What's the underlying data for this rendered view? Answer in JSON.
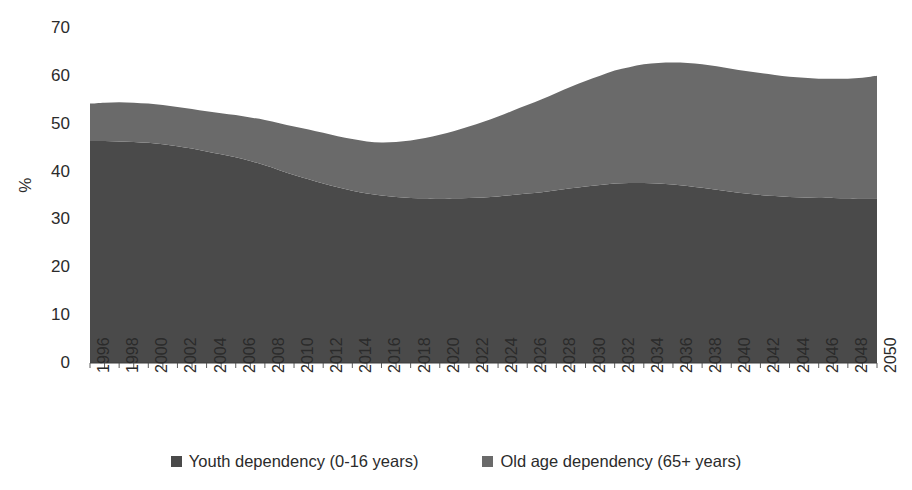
{
  "chart_data": {
    "type": "area",
    "stacked": true,
    "title": "",
    "subtitle": "",
    "xlabel": "",
    "ylabel": "%",
    "ylim": [
      0,
      70
    ],
    "ytick_step": 10,
    "yticks": [
      0,
      10,
      20,
      30,
      40,
      50,
      60,
      70
    ],
    "grid": false,
    "legend_position": "bottom",
    "x": [
      1996,
      1997,
      1998,
      1999,
      2000,
      2001,
      2002,
      2003,
      2004,
      2005,
      2006,
      2007,
      2008,
      2009,
      2010,
      2011,
      2012,
      2013,
      2014,
      2015,
      2016,
      2017,
      2018,
      2019,
      2020,
      2021,
      2022,
      2023,
      2024,
      2025,
      2026,
      2027,
      2028,
      2029,
      2030,
      2031,
      2032,
      2033,
      2034,
      2035,
      2036,
      2037,
      2038,
      2039,
      2040,
      2041,
      2042,
      2043,
      2044,
      2045,
      2046,
      2047,
      2048,
      2049,
      2050
    ],
    "xtick_labels": [
      "1996",
      "1998",
      "2000",
      "2002",
      "2004",
      "2006",
      "2008",
      "2010",
      "2012",
      "2014",
      "2016",
      "2018",
      "2020",
      "2022",
      "2024",
      "2026",
      "2028",
      "2030",
      "2032",
      "2034",
      "2036",
      "2038",
      "2040",
      "2042",
      "2044",
      "2046",
      "2048",
      "2050"
    ],
    "series": [
      {
        "name": "Youth dependency (0-16 years)",
        "color": "#4a4a4a",
        "values": [
          46.4,
          46.4,
          46.3,
          46.2,
          46.0,
          45.7,
          45.3,
          44.8,
          44.2,
          43.6,
          43.0,
          42.2,
          41.3,
          40.3,
          39.3,
          38.4,
          37.5,
          36.7,
          36.0,
          35.4,
          35.0,
          34.7,
          34.5,
          34.4,
          34.4,
          34.4,
          34.5,
          34.6,
          34.8,
          35.1,
          35.4,
          35.7,
          36.1,
          36.5,
          36.9,
          37.2,
          37.5,
          37.6,
          37.6,
          37.5,
          37.3,
          37.0,
          36.6,
          36.2,
          35.8,
          35.4,
          35.1,
          34.9,
          34.7,
          34.6,
          34.5,
          34.5,
          34.4,
          34.4,
          34.4
        ]
      },
      {
        "name": "Old age dependency (65+ years)",
        "color": "#6a6a6a",
        "values": [
          7.8,
          8.0,
          8.2,
          8.2,
          8.2,
          8.2,
          8.2,
          8.3,
          8.4,
          8.6,
          8.8,
          9.1,
          9.5,
          9.8,
          10.1,
          10.4,
          10.6,
          10.7,
          10.8,
          10.9,
          11.1,
          11.5,
          12.0,
          12.6,
          13.3,
          14.1,
          14.9,
          15.8,
          16.7,
          17.6,
          18.5,
          19.4,
          20.3,
          21.2,
          22.0,
          22.8,
          23.6,
          24.2,
          24.8,
          25.2,
          25.5,
          25.7,
          25.8,
          25.8,
          25.7,
          25.6,
          25.5,
          25.3,
          25.1,
          25.0,
          24.9,
          24.9,
          25.0,
          25.2,
          25.6
        ]
      }
    ],
    "totals": [
      54.2,
      54.4,
      54.5,
      54.4,
      54.2,
      53.9,
      53.5,
      53.1,
      52.6,
      52.2,
      51.8,
      51.3,
      50.8,
      50.1,
      49.4,
      48.8,
      48.1,
      47.4,
      46.8,
      46.3,
      46.1,
      46.2,
      46.5,
      47.0,
      47.7,
      48.5,
      49.4,
      50.4,
      51.5,
      52.7,
      53.9,
      55.1,
      56.4,
      57.7,
      58.9,
      60.0,
      61.1,
      61.8,
      62.4,
      62.7,
      62.8,
      62.7,
      62.4,
      62.0,
      61.5,
      61.0,
      60.6,
      60.2,
      59.8,
      59.6,
      59.4,
      59.4,
      59.4,
      59.6,
      60.0
    ]
  },
  "axis": {
    "y_title": "%",
    "y_tick_labels": [
      "70",
      "60",
      "50",
      "40",
      "30",
      "20",
      "10",
      "0"
    ]
  },
  "legend": {
    "entries": [
      {
        "label": "Youth dependency (0-16 years)",
        "color": "#4a4a4a",
        "marker": "square-marker"
      },
      {
        "label": "Old age dependency (65+ years)",
        "color": "#6a6a6a",
        "marker": "square-marker"
      }
    ]
  }
}
